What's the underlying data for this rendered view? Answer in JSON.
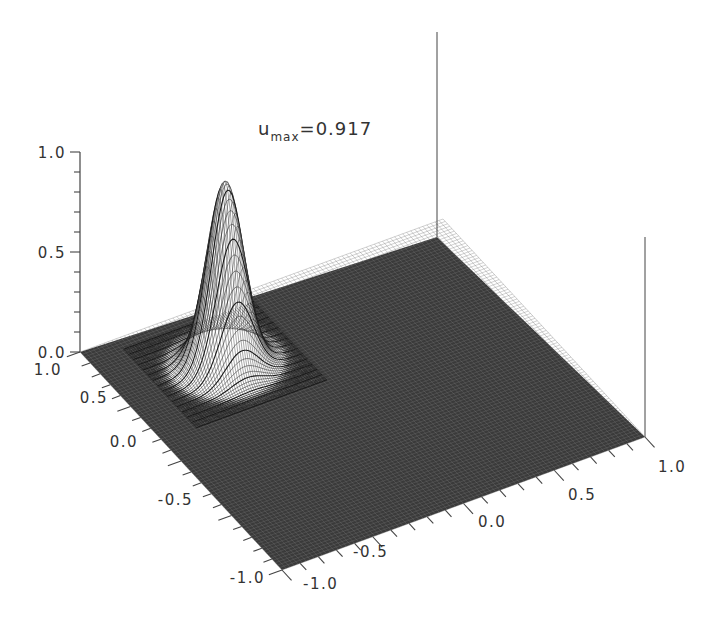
{
  "chart_data": {
    "type": "surface3d",
    "annotation": {
      "base": "u",
      "subscript": "max",
      "equals_value": "=0.917"
    },
    "z_axis": {
      "label": "",
      "range": [
        0.0,
        1.0
      ],
      "ticks": [
        "0.0",
        "0.5",
        "1.0"
      ],
      "minor_ticks_per_major": 5
    },
    "x_axis": {
      "label": "",
      "range": [
        -1.0,
        1.0
      ],
      "ticks": [
        "-1.0",
        "-0.5",
        "0.0",
        "0.5",
        "1.0"
      ],
      "position": "front-right edge"
    },
    "y_axis": {
      "label": "",
      "range": [
        -1.0,
        1.0
      ],
      "ticks": [
        "-1.0",
        "-0.5",
        "0.0",
        "0.5",
        "1.0"
      ],
      "position": "front-left edge"
    },
    "surface": {
      "description": "Single Gaussian-like peak on otherwise flat zero surface",
      "peak_value": 0.917,
      "peak_location_xy": [
        -0.45,
        0.55
      ],
      "peak_width_sigma": 0.09,
      "background_value": 0.0,
      "mesh": "wireframe, dense grid"
    },
    "grid": false,
    "legend": null
  },
  "colors": {
    "axis": "#444444",
    "mesh_line": "#1a1a1a",
    "surface_fill": "#ffffff",
    "text": "#333333"
  }
}
